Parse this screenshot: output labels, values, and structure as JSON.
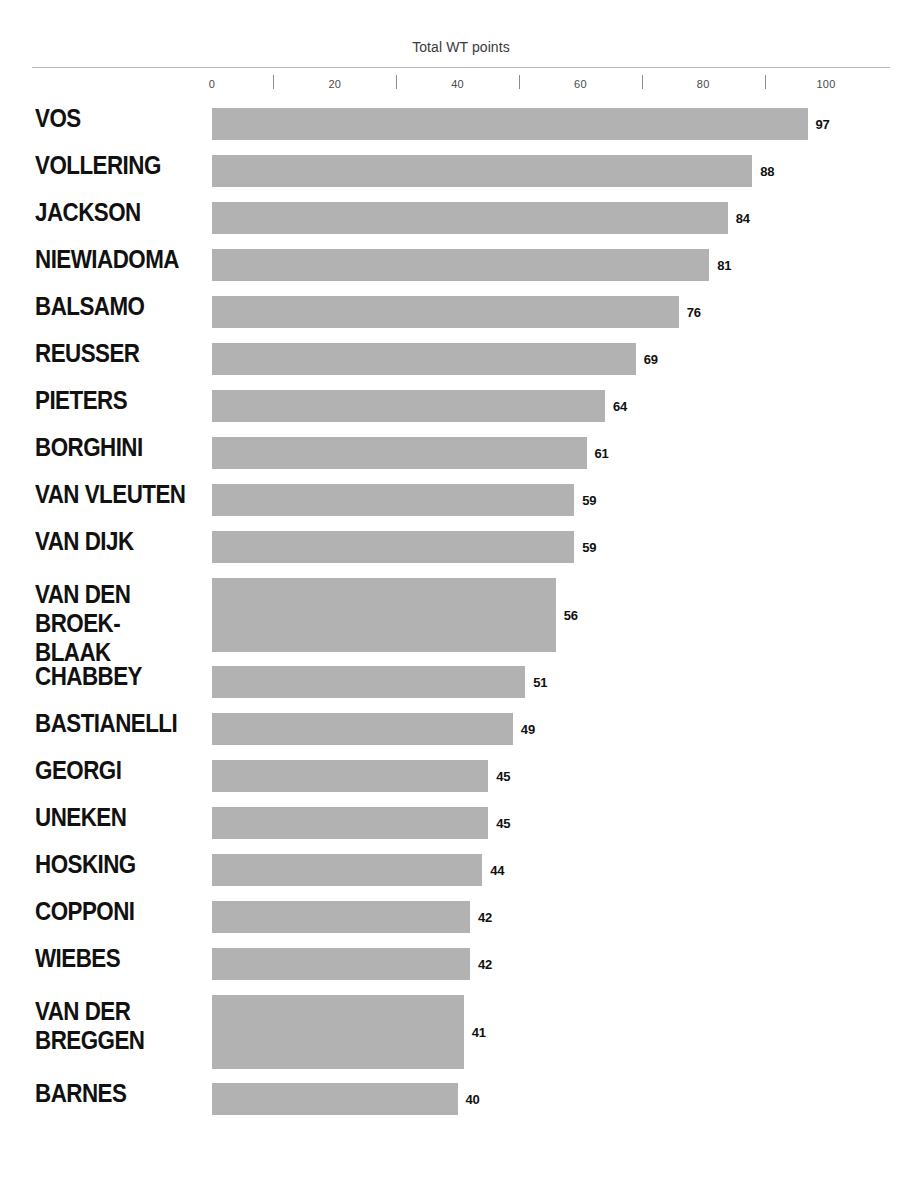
{
  "chart_data": {
    "type": "bar",
    "orientation": "horizontal",
    "title": "Total WT points",
    "xlabel": "",
    "ylabel": "",
    "xlim": [
      0,
      100
    ],
    "grid": false,
    "legend": null,
    "bar_color": "#b2b2b2",
    "tick_labels": [
      "0",
      "20",
      "40",
      "60",
      "80",
      "100"
    ],
    "tick_values": [
      0,
      20,
      40,
      60,
      80,
      100
    ],
    "minor_tick_values": [
      10,
      30,
      50,
      70,
      90
    ],
    "categories": [
      "VOS",
      "VOLLERING",
      "JACKSON",
      "NIEWIADOMA",
      "BALSAMO",
      "REUSSER",
      "PIETERS",
      "BORGHINI",
      "VAN VLEUTEN",
      "VAN DIJK",
      "VAN DEN BROEK-BLAAK",
      "CHABBEY",
      "BASTIANELLI",
      "GEORGI",
      "UNEKEN",
      "HOSKING",
      "COPPONI",
      "WIEBES",
      "VAN DER BREGGEN",
      "BARNES"
    ],
    "values": [
      97,
      88,
      84,
      81,
      76,
      69,
      64,
      61,
      59,
      59,
      56,
      51,
      49,
      45,
      45,
      44,
      42,
      42,
      41,
      40
    ],
    "rows": [
      {
        "label": "VOS",
        "label_lines": "VOS",
        "value": 97,
        "tall": false
      },
      {
        "label": "VOLLERING",
        "label_lines": "VOLLERING",
        "value": 88,
        "tall": false
      },
      {
        "label": "JACKSON",
        "label_lines": "JACKSON",
        "value": 84,
        "tall": false
      },
      {
        "label": "NIEWIADOMA",
        "label_lines": "NIEWIADOMA",
        "value": 81,
        "tall": false
      },
      {
        "label": "BALSAMO",
        "label_lines": "BALSAMO",
        "value": 76,
        "tall": false
      },
      {
        "label": "REUSSER",
        "label_lines": "REUSSER",
        "value": 69,
        "tall": false
      },
      {
        "label": "PIETERS",
        "label_lines": "PIETERS",
        "value": 64,
        "tall": false
      },
      {
        "label": "BORGHINI",
        "label_lines": "BORGHINI",
        "value": 61,
        "tall": false
      },
      {
        "label": "VAN VLEUTEN",
        "label_lines": "VAN VLEUTEN",
        "value": 59,
        "tall": false
      },
      {
        "label": "VAN DIJK",
        "label_lines": "VAN DIJK",
        "value": 59,
        "tall": false
      },
      {
        "label": "VAN DEN BROEK-BLAAK",
        "label_lines": "VAN DEN\nBROEK-BLAAK",
        "value": 56,
        "tall": true
      },
      {
        "label": "CHABBEY",
        "label_lines": "CHABBEY",
        "value": 51,
        "tall": false
      },
      {
        "label": "BASTIANELLI",
        "label_lines": "BASTIANELLI",
        "value": 49,
        "tall": false
      },
      {
        "label": "GEORGI",
        "label_lines": "GEORGI",
        "value": 45,
        "tall": false
      },
      {
        "label": "UNEKEN",
        "label_lines": "UNEKEN",
        "value": 45,
        "tall": false
      },
      {
        "label": "HOSKING",
        "label_lines": "HOSKING",
        "value": 44,
        "tall": false
      },
      {
        "label": "COPPONI",
        "label_lines": "COPPONI",
        "value": 42,
        "tall": false
      },
      {
        "label": "WIEBES",
        "label_lines": "WIEBES",
        "value": 42,
        "tall": false
      },
      {
        "label": "VAN DER BREGGEN",
        "label_lines": "VAN DER\nBREGGEN",
        "value": 41,
        "tall": true
      },
      {
        "label": "BARNES",
        "label_lines": "BARNES",
        "value": 40,
        "tall": false
      }
    ]
  }
}
